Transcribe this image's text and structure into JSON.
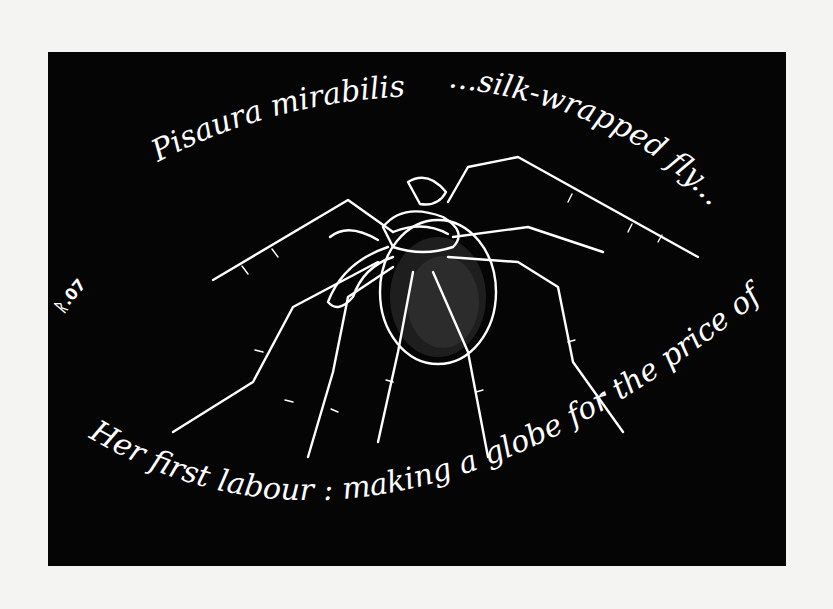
{
  "artwork": {
    "subject": "Hand-drawn white-line illustration of a nursery web spider carrying an egg sac, on black background",
    "caption_top_left": "Pisaura mirabilis",
    "caption_top_right": "...silk-wrapped fly...",
    "caption_bottom": "Her first labour : making a globe for the price of a",
    "signature": "ᚱ.07",
    "colors": {
      "background": "#050505",
      "ink": "#ffffff",
      "page": "#f4f4f2"
    }
  }
}
